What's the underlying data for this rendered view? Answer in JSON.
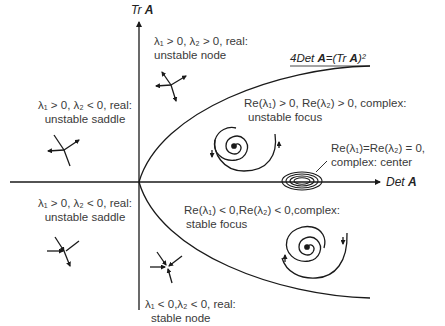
{
  "axes": {
    "y_label_prefix": "Tr ",
    "y_label_bold": "A",
    "x_label_prefix": "Det ",
    "x_label_bold": "A"
  },
  "curve": {
    "label": "4Det A=(Tr A)²",
    "label_part1": "4Det ",
    "label_bold1": "A",
    "label_part2": "=(Tr ",
    "label_bold2": "A",
    "label_part3": ")²"
  },
  "regions": {
    "unstable_node": {
      "line1": "λ₁ > 0, λ₂ > 0, real:",
      "line2": "unstable node",
      "icon": "unstable-node-icon"
    },
    "unstable_saddle_upper": {
      "line1": "λ₁ > 0, λ₂ < 0, real:",
      "line2": "unstable saddle",
      "icon": "saddle-icon"
    },
    "unstable_saddle_lower": {
      "line1": "λ₁ > 0, λ₂ < 0, real:",
      "line2": "unstable saddle",
      "icon": "saddle-icon"
    },
    "unstable_focus": {
      "line1": "Re(λ₁) > 0, Re(λ₂) > 0, complex:",
      "line2": "unstable focus",
      "icon": "outward-spiral-icon"
    },
    "center": {
      "line1": "Re(λ₁)=Re(λ₂) = 0,",
      "line2": "complex: center",
      "icon": "concentric-ellipses-icon"
    },
    "stable_focus": {
      "line1": "Re(λ₁) < 0,Re(λ₂) < 0,complex:",
      "line2": "stable focus",
      "icon": "inward-spiral-icon"
    },
    "stable_node": {
      "line1": "λ₁ < 0,λ₂ < 0, real:",
      "line2": "stable node",
      "icon": "stable-node-icon"
    }
  },
  "colors": {
    "line": "#1a1a1a",
    "text": "#3a3a3a",
    "background": "#ffffff"
  }
}
